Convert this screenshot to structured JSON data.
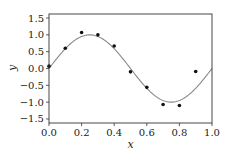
{
  "chart_data": {
    "type": "scatter",
    "title": "",
    "xlabel": "x",
    "ylabel": "y",
    "xlim": [
      0.0,
      1.0
    ],
    "ylim": [
      -1.62,
      1.62
    ],
    "grid": false,
    "legend": null,
    "x_ticks": [
      "0.0",
      "0.2",
      "0.4",
      "0.6",
      "0.8",
      "1.0"
    ],
    "y_ticks": [
      "1.5",
      "1.0",
      "0.5",
      "0.0",
      "−0.5",
      "−1.0",
      "−1.5"
    ],
    "series": [
      {
        "name": "observations",
        "type": "scatter",
        "color": "#111111",
        "x": [
          0.0,
          0.1,
          0.2,
          0.3,
          0.4,
          0.5,
          0.6,
          0.7,
          0.8,
          0.9
        ],
        "y": [
          0.07,
          0.6,
          1.07,
          1.0,
          0.67,
          -0.1,
          -0.56,
          -1.07,
          -1.1,
          -0.09
        ]
      },
      {
        "name": "sin(2πx)",
        "type": "line",
        "color": "#8a8a8a",
        "function": "sin(2*pi*x)",
        "x_range": [
          0.0,
          1.0
        ]
      }
    ]
  }
}
